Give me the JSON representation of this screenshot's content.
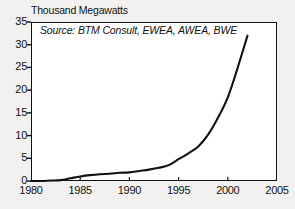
{
  "chart_data": {
    "type": "line",
    "title": "Thousand Megawatts",
    "subtitle": "",
    "xlabel": "",
    "ylabel": "",
    "annotation": "Source: BTM Consult, EWEA, AWEA, BWE",
    "grid": false,
    "legend": "none",
    "xlim": [
      1980,
      2005
    ],
    "ylim": [
      0,
      35
    ],
    "xticks": [
      1980,
      1985,
      1990,
      1995,
      2000,
      2005
    ],
    "yticks": [
      0,
      5,
      10,
      15,
      20,
      25,
      30,
      35
    ],
    "xtick_labels": [
      "1980",
      "1985",
      "1990",
      "1995",
      "2000",
      "2005"
    ],
    "ytick_labels": [
      "0",
      "5",
      "10",
      "15",
      "20",
      "25",
      "30",
      "35"
    ],
    "line_color": "#111111",
    "x": [
      1980,
      1981,
      1982,
      1983,
      1984,
      1985,
      1986,
      1987,
      1988,
      1989,
      1990,
      1991,
      1992,
      1993,
      1994,
      1995,
      1996,
      1997,
      1998,
      1999,
      2000,
      2001,
      2002
    ],
    "values": [
      0.0,
      0.0,
      0.1,
      0.2,
      0.6,
      1.0,
      1.3,
      1.5,
      1.6,
      1.8,
      1.9,
      2.2,
      2.5,
      2.9,
      3.5,
      4.8,
      6.1,
      7.6,
      10.2,
      13.9,
      18.4,
      24.9,
      32.0
    ],
    "series": [
      {
        "name": "World Wind Generating Capacity",
        "values": [
          0.0,
          0.0,
          0.1,
          0.2,
          0.6,
          1.0,
          1.3,
          1.5,
          1.6,
          1.8,
          1.9,
          2.2,
          2.5,
          2.9,
          3.5,
          4.8,
          6.1,
          7.6,
          10.2,
          13.9,
          18.4,
          24.9,
          32.0
        ]
      }
    ]
  },
  "figure": {
    "background_color": "#f2f1ef",
    "plot_background_color": "#ffffff",
    "frame_color": "#111111"
  }
}
